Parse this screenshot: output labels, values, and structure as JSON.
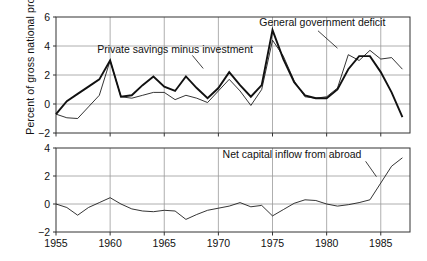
{
  "axis_label_y": "Percent of gross national product",
  "chart_data": [
    {
      "type": "line",
      "panel": "top",
      "title": "",
      "xlabel": "",
      "ylabel": "Percent of gross national product",
      "xlim": [
        1955,
        1987.7
      ],
      "ylim": [
        -2,
        6
      ],
      "yticks": [
        -2,
        0,
        2,
        4,
        6
      ],
      "ytick_labels": [
        "-2",
        "0",
        "2",
        "4",
        "6"
      ],
      "xticks": [
        1955,
        1960,
        1965,
        1970,
        1975,
        1980,
        1985
      ],
      "xtick_labels": [
        "1955",
        "1960",
        "1965",
        "1970",
        "1975",
        "1980",
        "1985"
      ],
      "grid": true,
      "legend_position": "annotations",
      "annotations": [
        {
          "text": "Private savings minus investment",
          "x": 1966.0,
          "y": 3.55
        },
        {
          "text": "General government deficit",
          "x": 1979.6,
          "y": 5.35
        }
      ],
      "series": [
        {
          "name": "General government deficit",
          "style": "thick",
          "x": [
            1955,
            1956,
            1957,
            1958,
            1959,
            1960,
            1961,
            1962,
            1963,
            1964,
            1965,
            1966,
            1967,
            1968,
            1969,
            1970,
            1971,
            1972,
            1973,
            1974,
            1975,
            1976,
            1977,
            1978,
            1979,
            1980,
            1981,
            1982,
            1983,
            1984,
            1985,
            1986,
            1987
          ],
          "values": [
            -0.7,
            0.2,
            0.7,
            1.2,
            1.7,
            3.0,
            0.5,
            0.6,
            1.3,
            1.9,
            1.2,
            0.9,
            1.9,
            1.1,
            0.4,
            1.1,
            2.2,
            1.3,
            0.5,
            1.3,
            5.1,
            3.1,
            1.5,
            0.6,
            0.4,
            0.4,
            1.0,
            2.4,
            3.3,
            3.3,
            2.2,
            0.8,
            -0.9
          ]
        },
        {
          "name": "Private savings minus investment",
          "style": "thin",
          "x": [
            1955,
            1956,
            1957,
            1958,
            1959,
            1960,
            1961,
            1962,
            1963,
            1964,
            1965,
            1966,
            1967,
            1968,
            1969,
            1970,
            1971,
            1972,
            1973,
            1974,
            1975,
            1976,
            1977,
            1978,
            1979,
            1980,
            1981,
            1982,
            1983,
            1984,
            1985,
            1986,
            1987
          ],
          "values": [
            -0.7,
            -0.95,
            -1.0,
            -0.2,
            0.6,
            3.0,
            0.5,
            0.4,
            0.6,
            0.8,
            0.8,
            0.3,
            0.6,
            0.4,
            0.1,
            0.9,
            1.7,
            0.9,
            -0.1,
            1.0,
            4.4,
            3.3,
            1.6,
            0.5,
            0.4,
            0.5,
            1.1,
            3.4,
            3.0,
            3.7,
            3.1,
            3.2,
            2.4
          ]
        }
      ]
    },
    {
      "type": "line",
      "panel": "bottom",
      "title": "",
      "xlabel": "",
      "ylabel": "",
      "xlim": [
        1955,
        1987.7
      ],
      "ylim": [
        -2,
        4
      ],
      "yticks": [
        -2,
        0,
        2,
        4
      ],
      "ytick_labels": [
        "-2",
        "0",
        "2",
        "4"
      ],
      "xticks": [
        1955,
        1960,
        1965,
        1970,
        1975,
        1980,
        1985
      ],
      "xtick_labels": [
        "1955",
        "1960",
        "1965",
        "1970",
        "1975",
        "1980",
        "1985"
      ],
      "grid": true,
      "legend_position": "annotations",
      "annotations": [
        {
          "text": "Net capital inflow from abroad",
          "x": 1976.8,
          "y": 3.3
        }
      ],
      "series": [
        {
          "name": "Net capital inflow from abroad",
          "style": "thin",
          "x": [
            1955,
            1956,
            1957,
            1958,
            1959,
            1960,
            1961,
            1962,
            1963,
            1964,
            1965,
            1966,
            1967,
            1968,
            1969,
            1970,
            1971,
            1972,
            1973,
            1974,
            1975,
            1976,
            1977,
            1978,
            1979,
            1980,
            1981,
            1982,
            1983,
            1984,
            1985,
            1986,
            1987
          ],
          "values": [
            0.0,
            -0.25,
            -0.8,
            -0.25,
            0.1,
            0.45,
            0.0,
            -0.35,
            -0.5,
            -0.55,
            -0.45,
            -0.5,
            -1.1,
            -0.75,
            -0.45,
            -0.3,
            -0.15,
            0.1,
            -0.2,
            -0.1,
            -0.85,
            -0.4,
            0.05,
            0.3,
            0.25,
            0.0,
            -0.15,
            -0.05,
            0.1,
            0.3,
            1.5,
            2.7,
            3.3
          ]
        }
      ]
    }
  ]
}
